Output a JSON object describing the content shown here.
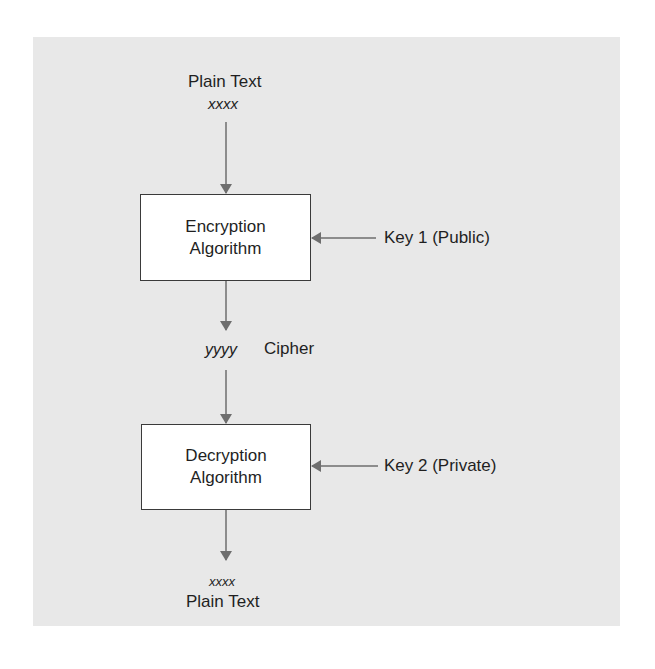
{
  "diagram": {
    "type": "flowchart",
    "top": {
      "label": "Plain Text",
      "value": "xxxx"
    },
    "encryption_box": {
      "line1": "Encryption",
      "line2": "Algorithm"
    },
    "key1": {
      "label": "Key 1 (Public)"
    },
    "cipher": {
      "value": "yyyy",
      "label": "Cipher"
    },
    "decryption_box": {
      "line1": "Decryption",
      "line2": "Algorithm"
    },
    "key2": {
      "label": "Key 2 (Private)"
    },
    "bottom": {
      "value": "xxxx",
      "label": "Plain Text"
    },
    "colors": {
      "panel": "#e8e8e8",
      "box_fill": "#ffffff",
      "arrow": "#6e6e6e",
      "text": "#1f1f1f"
    }
  }
}
